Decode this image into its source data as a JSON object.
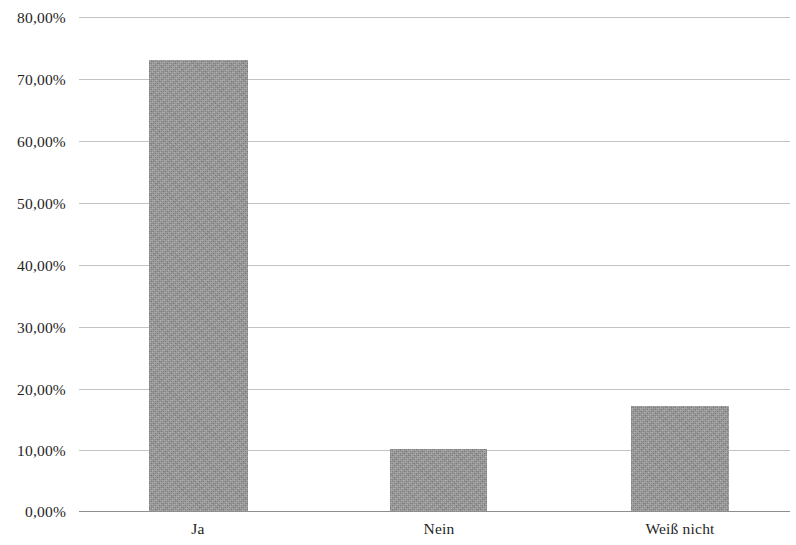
{
  "chart_data": {
    "type": "bar",
    "title": "",
    "subtitle": "",
    "xlabel": "",
    "ylabel": "",
    "categories": [
      "Ja",
      "Nein",
      "Weiß nicht"
    ],
    "values": [
      73.0,
      10.0,
      17.0
    ],
    "series": [
      {
        "name": "",
        "values": [
          73.0,
          10.0,
          17.0
        ]
      }
    ],
    "ylim": [
      0,
      80
    ],
    "ytick_values": [
      0,
      10,
      20,
      30,
      40,
      50,
      60,
      70,
      80
    ],
    "ytick_labels": [
      "0,00%",
      "10,00%",
      "20,00%",
      "30,00%",
      "40,00%",
      "50,00%",
      "60,00%",
      "70,00%",
      "80,00%"
    ],
    "value_format": "percent-de",
    "grid": true,
    "grid_axis": "y",
    "legend": false,
    "legend_position": "none",
    "annotations": [],
    "colors": {
      "bar_fill": "#949494",
      "gridline": "#b9b9bc",
      "axis_line": "#8e8e90",
      "text": "#1f1f1f",
      "background": "#ffffff"
    }
  }
}
